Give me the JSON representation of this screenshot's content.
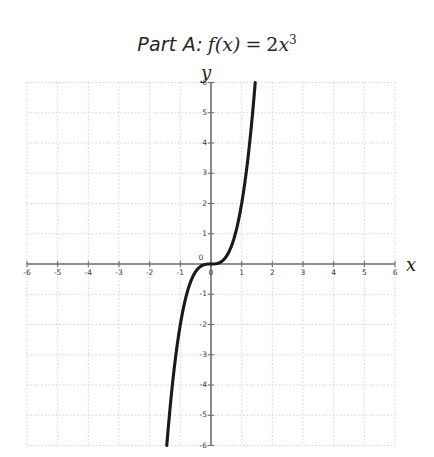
{
  "title": {
    "prefix": "Part A:",
    "function_name": "f(x)",
    "equals": "=",
    "coefficient": "2",
    "variable": "x",
    "exponent": "3",
    "full_text": "Part A: f(x) = 2x^3"
  },
  "axes": {
    "x_label": "x",
    "y_label": "y",
    "origin_label": "0"
  },
  "colors": {
    "curve": "#1a1a1a",
    "axis": "#6e6e6e",
    "grid": "#cfcfd6",
    "text": "#262626",
    "background": "#ffffff"
  },
  "chart_data": {
    "type": "line",
    "subtitle": "",
    "xlabel": "x",
    "ylabel": "y",
    "equation": "f(x) = 2x^3",
    "xlim": [
      -6,
      6
    ],
    "ylim": [
      -6,
      6
    ],
    "xticks": [
      -6,
      -5,
      -4,
      -3,
      -2,
      -1,
      0,
      1,
      2,
      3,
      4,
      5,
      6
    ],
    "yticks": [
      -6,
      -5,
      -4,
      -3,
      -2,
      -1,
      0,
      1,
      2,
      3,
      4,
      5,
      6
    ],
    "xtick_labels": [
      "-6",
      "-5",
      "-4",
      "-3",
      "-2",
      "-1",
      "0",
      "1",
      "2",
      "3",
      "4",
      "5",
      "6"
    ],
    "ytick_labels": [
      "-6",
      "-5",
      "-4",
      "-3",
      "-2",
      "-1",
      "0",
      "1",
      "2",
      "3",
      "4",
      "5",
      "6"
    ],
    "grid": true,
    "grid_style": "dotted",
    "legend": false,
    "legend_position": "none",
    "series": [
      {
        "name": "f(x) = 2x^3",
        "color": "#1a1a1a",
        "x": [
          -1.442,
          -1.4,
          -1.35,
          -1.3,
          -1.25,
          -1.2,
          -1.15,
          -1.1,
          -1.05,
          -1.0,
          -0.95,
          -0.9,
          -0.85,
          -0.8,
          -0.75,
          -0.7,
          -0.65,
          -0.6,
          -0.55,
          -0.5,
          -0.45,
          -0.4,
          -0.35,
          -0.3,
          -0.25,
          -0.2,
          -0.15,
          -0.1,
          -0.05,
          0.0,
          0.05,
          0.1,
          0.15,
          0.2,
          0.25,
          0.3,
          0.35,
          0.4,
          0.45,
          0.5,
          0.55,
          0.6,
          0.65,
          0.7,
          0.75,
          0.8,
          0.85,
          0.9,
          0.95,
          1.0,
          1.05,
          1.1,
          1.15,
          1.2,
          1.25,
          1.3,
          1.35,
          1.4,
          1.442
        ],
        "y": [
          -6.0,
          -5.488,
          -4.921,
          -4.394,
          -3.906,
          -3.456,
          -3.042,
          -2.662,
          -2.315,
          -2.0,
          -1.715,
          -1.458,
          -1.228,
          -1.024,
          -0.844,
          -0.686,
          -0.549,
          -0.432,
          -0.333,
          -0.25,
          -0.182,
          -0.128,
          -0.086,
          -0.054,
          -0.031,
          -0.016,
          -0.007,
          -0.002,
          0.0,
          0.0,
          0.0,
          0.002,
          0.007,
          0.016,
          0.031,
          0.054,
          0.086,
          0.128,
          0.182,
          0.25,
          0.333,
          0.432,
          0.549,
          0.686,
          0.844,
          1.024,
          1.228,
          1.458,
          1.715,
          2.0,
          2.315,
          2.662,
          3.042,
          3.456,
          3.906,
          4.394,
          4.921,
          5.488,
          6.0
        ]
      }
    ],
    "annotations": []
  }
}
